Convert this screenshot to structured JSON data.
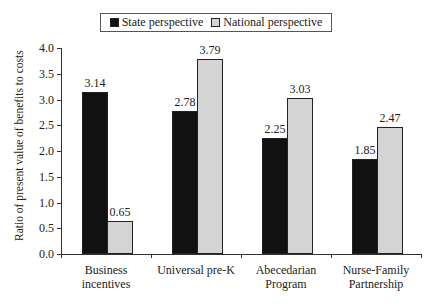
{
  "chart_data": {
    "type": "bar",
    "title": "",
    "xlabel": "",
    "ylabel": "Ratio of present value of benefits to costs",
    "ylim": [
      0,
      4.0
    ],
    "yticks": [
      "0.0",
      "0.5",
      "1.0",
      "1.5",
      "2.0",
      "2.5",
      "3.0",
      "3.5",
      "4.0"
    ],
    "categories": [
      "Business incentives",
      "Universal pre-K",
      "Abecedarian Program",
      "Nurse-Family Partnership"
    ],
    "category_lines": [
      [
        "Business",
        "incentives"
      ],
      [
        "Universal pre-K",
        ""
      ],
      [
        "Abecedarian",
        "Program"
      ],
      [
        "Nurse-Family",
        "Partnership"
      ]
    ],
    "series": [
      {
        "name": "State perspective",
        "color": "#111111",
        "values": [
          3.14,
          2.78,
          2.25,
          1.85
        ],
        "labels": [
          "3.14",
          "2.78",
          "2.25",
          "1.85"
        ]
      },
      {
        "name": "National perspective",
        "color": "#d4d4d4",
        "values": [
          0.65,
          3.79,
          3.03,
          2.47
        ],
        "labels": [
          "0.65",
          "3.79",
          "3.03",
          "2.47"
        ]
      }
    ],
    "legend_position": "top",
    "grid": false
  }
}
